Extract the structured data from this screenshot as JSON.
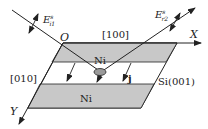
{
  "diagram": {
    "labels": {
      "origin": "O",
      "x_axis": "X",
      "y_axis": "Y",
      "dir_x": "[100]",
      "dir_y": "[010]",
      "ni_top": "Ni",
      "ni_bottom": "Ni",
      "substrate": "Si(001)",
      "current": "j",
      "incident_field": "E",
      "incident_sup": "s",
      "incident_sub": "i1",
      "reflected_field": "E",
      "reflected_sup": "s",
      "reflected_sub": "r2"
    },
    "colors": {
      "ni_fill": "#c8c8c8",
      "line": "#222222",
      "ellipse_fill": "#9a9a9a"
    }
  }
}
